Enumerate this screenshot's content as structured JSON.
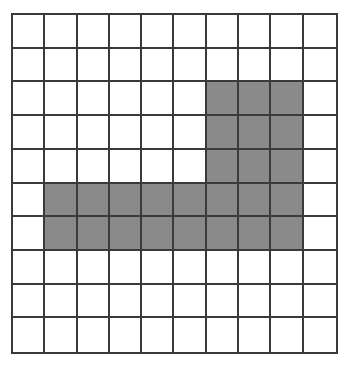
{
  "diagram": {
    "type": "grid",
    "rows": 10,
    "cols": 10,
    "line_color": "#3a3a3a",
    "fill_color": "#8a8a8a",
    "background_color": "#ffffff",
    "shaded_cells": [
      [
        2,
        6
      ],
      [
        2,
        7
      ],
      [
        2,
        8
      ],
      [
        3,
        6
      ],
      [
        3,
        7
      ],
      [
        3,
        8
      ],
      [
        4,
        6
      ],
      [
        4,
        7
      ],
      [
        4,
        8
      ],
      [
        5,
        1
      ],
      [
        5,
        2
      ],
      [
        5,
        3
      ],
      [
        5,
        4
      ],
      [
        5,
        5
      ],
      [
        5,
        6
      ],
      [
        5,
        7
      ],
      [
        5,
        8
      ],
      [
        6,
        1
      ],
      [
        6,
        2
      ],
      [
        6,
        3
      ],
      [
        6,
        4
      ],
      [
        6,
        5
      ],
      [
        6,
        6
      ],
      [
        6,
        7
      ],
      [
        6,
        8
      ]
    ]
  }
}
